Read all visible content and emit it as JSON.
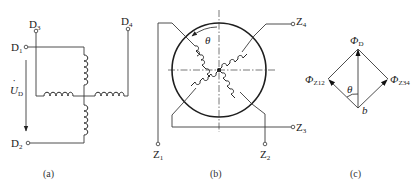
{
  "panels": [
    {
      "id": "a",
      "caption": "(a)",
      "description": "Primary (excitation) winding: two orthogonal coils, terminals D1-D2 driven by voltage U_D, D3-D4 shorted/second winding",
      "terminals": {
        "d1": {
          "main": "D",
          "sub": "1"
        },
        "d2": {
          "main": "D",
          "sub": "2"
        },
        "d3": {
          "main": "D",
          "sub": "3"
        },
        "d4": {
          "main": "D",
          "sub": "4"
        }
      },
      "voltage_label": {
        "main": "U",
        "sub": "D",
        "dot": "·"
      }
    },
    {
      "id": "b",
      "caption": "(b)",
      "description": "Rotor with two orthogonal windings at angle theta",
      "angle_label": "θ",
      "terminals": {
        "z1": {
          "main": "Z",
          "sub": "1"
        },
        "z2": {
          "main": "Z",
          "sub": "2"
        },
        "z3": {
          "main": "Z",
          "sub": "3"
        },
        "z4": {
          "main": "Z",
          "sub": "4"
        }
      }
    },
    {
      "id": "c",
      "caption": "(c)",
      "description": "Flux phasor decomposition",
      "vectors": {
        "phi_d": {
          "main": "Φ",
          "sub": "D"
        },
        "phi_z12": {
          "main": "Φ",
          "sub": "Z12"
        },
        "phi_z34": {
          "main": "Φ",
          "sub": "Z34"
        }
      },
      "angle_label": "θ",
      "origin_label": "b"
    }
  ],
  "colors": {
    "line": "#3a3a3a",
    "background": "#ffffff"
  }
}
